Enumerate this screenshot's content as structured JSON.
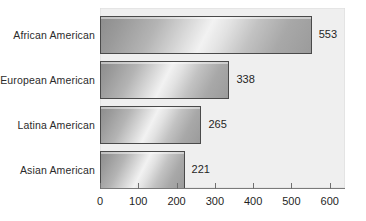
{
  "chart_data": {
    "type": "bar",
    "orientation": "horizontal",
    "title": "",
    "subtitle": "",
    "xlabel": "",
    "ylabel": "",
    "categories": [
      "African American",
      "European American",
      "Latina American",
      "Asian American"
    ],
    "values": [
      553,
      338,
      265,
      221
    ],
    "value_labels": [
      "553",
      "338",
      "265",
      "221"
    ],
    "xlim": [
      0,
      640
    ],
    "xticks": [
      0,
      100,
      200,
      300,
      400,
      500,
      600
    ],
    "xtick_labels": [
      "0",
      "100",
      "200",
      "300",
      "400",
      "500",
      "600"
    ],
    "grid": false,
    "legend": null,
    "series": [
      {
        "name": "",
        "values": [
          553,
          338,
          265,
          221
        ]
      }
    ],
    "colors": {
      "plot_background": "#efefef",
      "page_background": "#ffffff",
      "bar_outline": "#4a4a4a",
      "bar_gradient_dark": "#8d8d8d",
      "bar_gradient_light": "#f2f2f2",
      "text": "#1f1f1f",
      "axis": "#7a7a7a"
    }
  }
}
